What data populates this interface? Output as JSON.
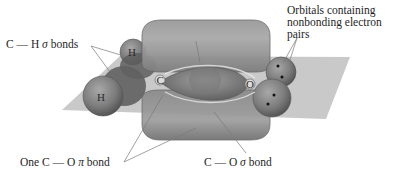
{
  "diagram": {
    "labels": {
      "ch_sigma": {
        "prefix": "C — H ",
        "symbol": "σ",
        "suffix": " bonds"
      },
      "co_pi": {
        "prefix": "One C — O ",
        "symbol": "π",
        "suffix": " bond"
      },
      "co_sigma": {
        "prefix": "C — O ",
        "symbol": "σ",
        "suffix": " bond"
      },
      "nonbonding": {
        "line1": "Orbitals containing",
        "line2": "nonbonding electron",
        "line3": "pairs"
      }
    },
    "atoms": {
      "carbon": "C",
      "oxygen": "O",
      "hydrogen_top": "H",
      "hydrogen_bottom": "H"
    },
    "colors": {
      "plane": "#b4b4b4",
      "pi_lobe": "#8e8e8e",
      "sigma_lobe": "#7a7a7a",
      "atom_sphere": "#6e6e6e",
      "leader_line": "#7a7a7a",
      "text": "#1e1e1e"
    }
  }
}
